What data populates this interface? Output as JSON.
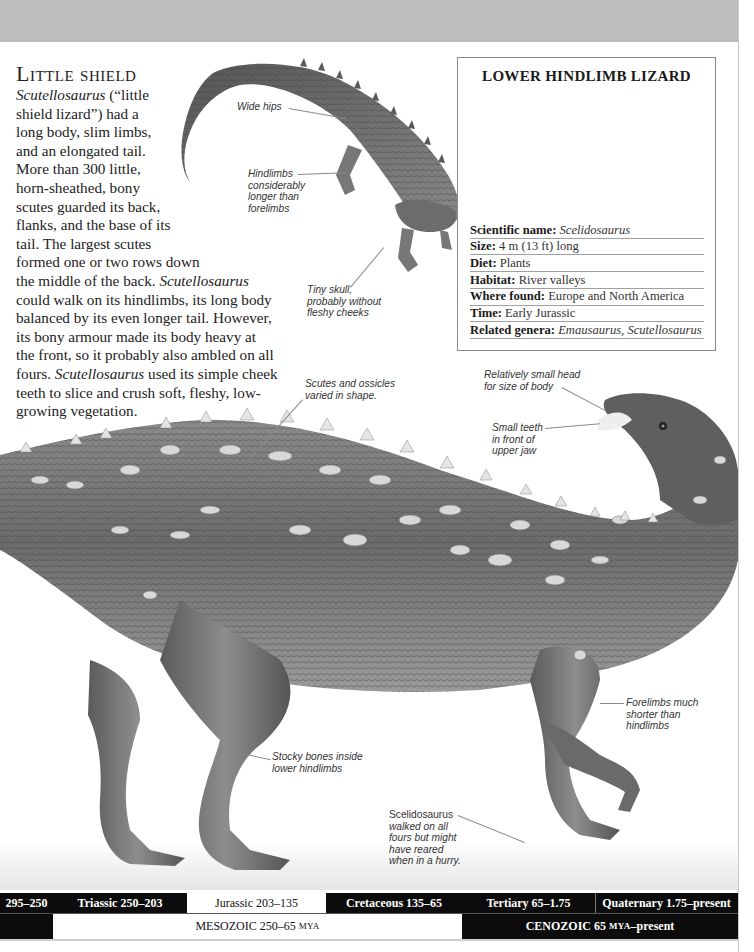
{
  "page": {
    "background": "#ffffff",
    "top_band_color": "#bdbdbd"
  },
  "intro": {
    "heading": "Little shield",
    "lines": [
      {
        "it": "Scutellosaurus",
        "text": " (“little"
      },
      {
        "text": "shield lizard”) had a"
      },
      {
        "text": "long body, slim limbs,"
      },
      {
        "text": "and an elongated tail."
      },
      {
        "text": "More than 300 little,"
      },
      {
        "text": "horn-sheathed, bony"
      },
      {
        "text": "scutes guarded its back,"
      },
      {
        "text": "flanks, and the base of its"
      },
      {
        "text": "tail. The largest scutes"
      },
      {
        "text": "formed one or two rows down"
      },
      {
        "pre": "the middle of the back. ",
        "it": "Scutellosaurus"
      },
      {
        "text": "could walk on its hindlimbs, its long body"
      },
      {
        "text": "balanced by its even longer tail. However,"
      },
      {
        "text": "its bony armour made its body heavy at"
      },
      {
        "text": "the front, so it probably also ambled on all"
      },
      {
        "pre": "fours. ",
        "it": "Scutellosaurus",
        "text": " used its simple cheek"
      },
      {
        "text": "teeth to slice and crush soft, fleshy, low-"
      },
      {
        "text": "growing vegetation."
      }
    ]
  },
  "factbox": {
    "title": "LOWER HINDLIMB LIZARD",
    "silhouette_color": "#a9a9a9",
    "human_color": "#d2d2d2",
    "facts": [
      {
        "label": "Scientific name:",
        "value": "Scelidosaurus",
        "italic": true
      },
      {
        "label": "Size:",
        "value": "4 m (13 ft) long",
        "italic": false
      },
      {
        "label": "Diet:",
        "value": "Plants",
        "italic": false
      },
      {
        "label": "Habitat:",
        "value": "River valleys",
        "italic": false
      },
      {
        "label": "Where found:",
        "value": "Europe and North America",
        "italic": false
      },
      {
        "label": "Time:",
        "value": "Early Jurassic",
        "italic": false
      },
      {
        "label": "Related genera:",
        "value": "Emausaurus, Scutellosaurus",
        "italic": true
      }
    ]
  },
  "labels": {
    "wide_hips": "Wide hips",
    "hindlimbs": [
      "Hindlimbs",
      "considerably",
      "longer than",
      "forelimbs"
    ],
    "tiny_skull": [
      "Tiny skull,",
      "probably without",
      "fleshy cheeks"
    ],
    "scutes": [
      "Scutes and ossicles",
      "varied in shape."
    ],
    "small_head": [
      "Relatively small head",
      "for size of body"
    ],
    "small_teeth": [
      "Small teeth",
      "in front of",
      "upper jaw"
    ],
    "forelimbs": [
      "Forelimbs much",
      "shorter than",
      "hindlimbs"
    ],
    "stocky": [
      "Stocky bones inside",
      "lower hindlimbs"
    ],
    "scelidosaurus": [
      "Scelidosaurus",
      "walked on all",
      "fours but might",
      "have reared",
      "when in a hurry."
    ]
  },
  "timeline": {
    "periods": [
      {
        "label": "295–250",
        "dark": true
      },
      {
        "label": "Triassic 250–203",
        "dark": true
      },
      {
        "label": "Jurassic 203–135",
        "dark": false
      },
      {
        "label": "Cretaceous 135–65",
        "dark": true
      },
      {
        "label": "Tertiary 65–1.75",
        "dark": true
      },
      {
        "label": "Quaternary 1.75–present",
        "dark": true
      }
    ],
    "eras": {
      "mesozoic": {
        "main": "MESOZOIC 250–65 ",
        "unit": "MYA"
      },
      "cenozoic": {
        "main": "CENOZOIC 65 ",
        "unit": "MYA",
        "tail": "–present"
      }
    }
  }
}
